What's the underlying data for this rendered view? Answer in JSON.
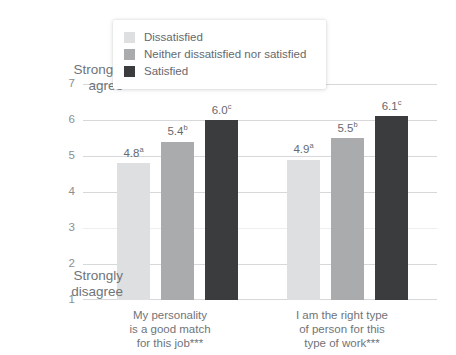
{
  "chart_data": {
    "type": "bar",
    "title": "",
    "xlabel": "",
    "ylabel": "",
    "ylim": [
      1,
      7
    ],
    "yticks": [
      "7",
      "6",
      "5",
      "4",
      "3",
      "2",
      "1"
    ],
    "grid": true,
    "legend_position": "top-center",
    "axis_anchor_high": "Strongly\nagree",
    "axis_anchor_high_line1": "Strongly",
    "axis_anchor_high_line2": "agree",
    "axis_anchor_low_line1": "Strongly",
    "axis_anchor_low_line2": "disagree",
    "categories": [
      "My personality is a good match for this job***",
      "I am the right type of person for this type of work***"
    ],
    "category_lines": [
      [
        "My personality",
        "is a good match",
        "for this job***"
      ],
      [
        "I am the right type",
        "of person for this",
        "type of work***"
      ]
    ],
    "series": [
      {
        "name": "Dissatisfied",
        "color": "#dedfe0",
        "values": [
          4.8,
          4.9
        ],
        "labels": [
          "4.8",
          "4.9"
        ],
        "label_superscripts": [
          "a",
          "a"
        ]
      },
      {
        "name": "Neither dissatisfied nor satisfied",
        "color": "#a9abad",
        "values": [
          5.4,
          5.5
        ],
        "labels": [
          "5.4",
          "5.5"
        ],
        "label_superscripts": [
          "b",
          "b"
        ]
      },
      {
        "name": "Satisfied",
        "color": "#3b3c3e",
        "values": [
          6.0,
          6.1
        ],
        "labels": [
          "6.0",
          "6.1"
        ],
        "label_superscripts": [
          "c",
          "c"
        ]
      }
    ]
  }
}
